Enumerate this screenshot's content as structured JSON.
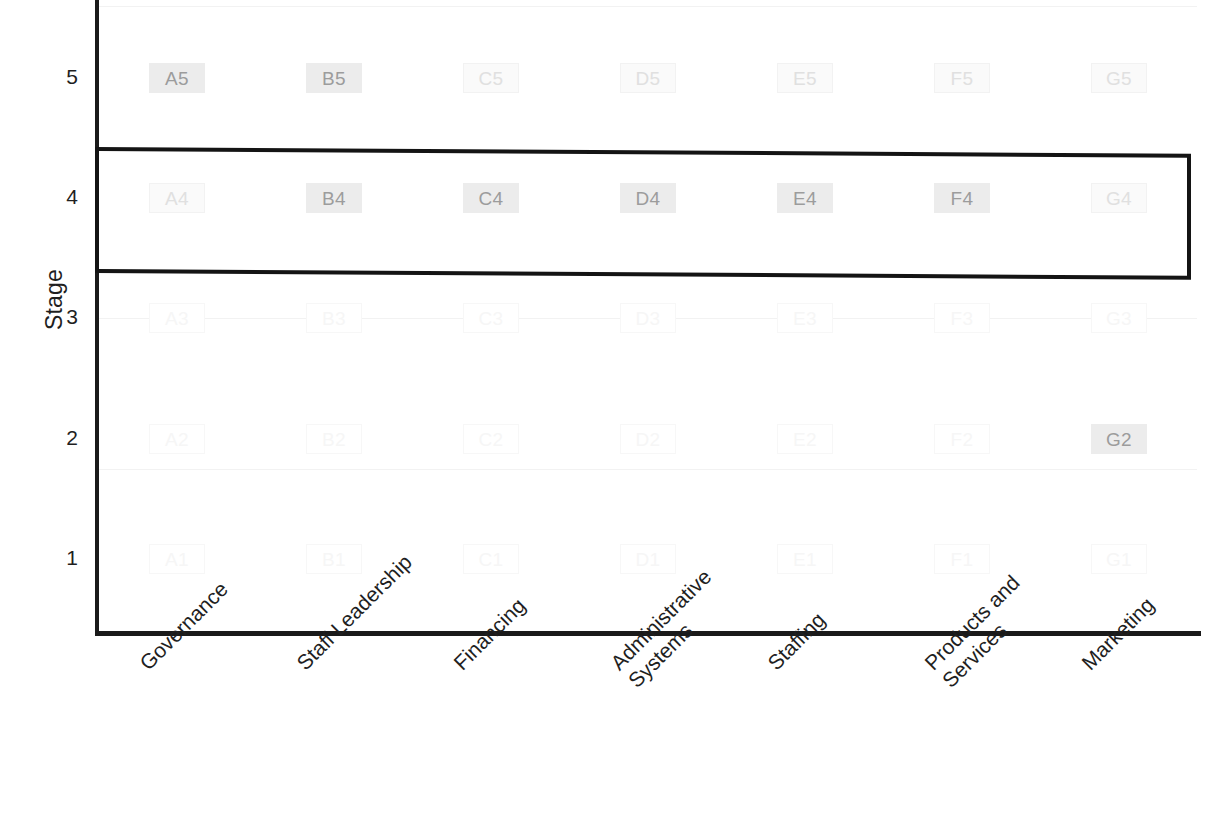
{
  "chart_data": {
    "type": "scatter",
    "title": "",
    "xlabel": "",
    "ylabel": "Stage",
    "grid": true,
    "legend": "none",
    "ylim": [
      0.4,
      5.6
    ],
    "y_ticks": [
      "1",
      "2",
      "3",
      "4",
      "5"
    ],
    "categories": [
      "Governance",
      "Staff Leadership",
      "Financing",
      "Administrative\nSystems",
      "Staffing",
      "Products and\nServices",
      "Marketing"
    ],
    "column_codes": [
      "A",
      "B",
      "C",
      "D",
      "E",
      "F",
      "G"
    ],
    "cells": [
      {
        "label": "A5",
        "col": 0,
        "stage": 5,
        "emphasis": "strong"
      },
      {
        "label": "B5",
        "col": 1,
        "stage": 5,
        "emphasis": "strong"
      },
      {
        "label": "C5",
        "col": 2,
        "stage": 5,
        "emphasis": "faint"
      },
      {
        "label": "D5",
        "col": 3,
        "stage": 5,
        "emphasis": "faint"
      },
      {
        "label": "E5",
        "col": 4,
        "stage": 5,
        "emphasis": "faint"
      },
      {
        "label": "F5",
        "col": 5,
        "stage": 5,
        "emphasis": "faint"
      },
      {
        "label": "G5",
        "col": 6,
        "stage": 5,
        "emphasis": "faint"
      },
      {
        "label": "A4",
        "col": 0,
        "stage": 4,
        "emphasis": "faint"
      },
      {
        "label": "B4",
        "col": 1,
        "stage": 4,
        "emphasis": "strong"
      },
      {
        "label": "C4",
        "col": 2,
        "stage": 4,
        "emphasis": "strong"
      },
      {
        "label": "D4",
        "col": 3,
        "stage": 4,
        "emphasis": "strong"
      },
      {
        "label": "E4",
        "col": 4,
        "stage": 4,
        "emphasis": "strong"
      },
      {
        "label": "F4",
        "col": 5,
        "stage": 4,
        "emphasis": "strong"
      },
      {
        "label": "G4",
        "col": 6,
        "stage": 4,
        "emphasis": "faint"
      },
      {
        "label": "A3",
        "col": 0,
        "stage": 3,
        "emphasis": "ghost"
      },
      {
        "label": "B3",
        "col": 1,
        "stage": 3,
        "emphasis": "ghost"
      },
      {
        "label": "C3",
        "col": 2,
        "stage": 3,
        "emphasis": "ghost"
      },
      {
        "label": "D3",
        "col": 3,
        "stage": 3,
        "emphasis": "ghost"
      },
      {
        "label": "E3",
        "col": 4,
        "stage": 3,
        "emphasis": "ghost"
      },
      {
        "label": "F3",
        "col": 5,
        "stage": 3,
        "emphasis": "ghost"
      },
      {
        "label": "G3",
        "col": 6,
        "stage": 3,
        "emphasis": "ghost"
      },
      {
        "label": "A2",
        "col": 0,
        "stage": 2,
        "emphasis": "ghost"
      },
      {
        "label": "B2",
        "col": 1,
        "stage": 2,
        "emphasis": "ghost"
      },
      {
        "label": "C2",
        "col": 2,
        "stage": 2,
        "emphasis": "ghost"
      },
      {
        "label": "D2",
        "col": 3,
        "stage": 2,
        "emphasis": "ghost"
      },
      {
        "label": "E2",
        "col": 4,
        "stage": 2,
        "emphasis": "ghost"
      },
      {
        "label": "F2",
        "col": 5,
        "stage": 2,
        "emphasis": "ghost"
      },
      {
        "label": "G2",
        "col": 6,
        "stage": 2,
        "emphasis": "strong"
      },
      {
        "label": "A1",
        "col": 0,
        "stage": 1,
        "emphasis": "ghost"
      },
      {
        "label": "B1",
        "col": 1,
        "stage": 1,
        "emphasis": "ghost"
      },
      {
        "label": "C1",
        "col": 2,
        "stage": 1,
        "emphasis": "ghost"
      },
      {
        "label": "D1",
        "col": 3,
        "stage": 1,
        "emphasis": "ghost"
      },
      {
        "label": "E1",
        "col": 4,
        "stage": 1,
        "emphasis": "ghost"
      },
      {
        "label": "F1",
        "col": 5,
        "stage": 1,
        "emphasis": "ghost"
      },
      {
        "label": "G1",
        "col": 6,
        "stage": 1,
        "emphasis": "ghost"
      }
    ],
    "highlight": {
      "stage": 4,
      "note": "thick black rectangle enclosing the entire Stage 4 row",
      "color": "#141414"
    },
    "colors": {
      "axis": "#1a1a1a",
      "grid": "#f2f2f2",
      "text": "#1f1f1f",
      "cell_strong": "#a8a8a8",
      "cell_faint": "#e2e2e2",
      "cell_ghost": "#f7f7f7"
    }
  }
}
